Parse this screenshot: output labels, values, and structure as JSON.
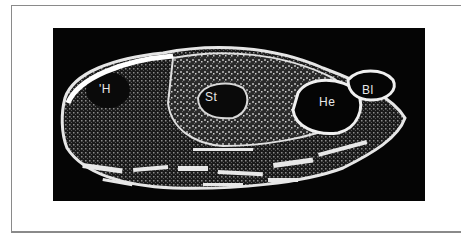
{
  "figure": {
    "labels": {
      "h": "'H",
      "st": "St",
      "he": "He",
      "bl": "Bl"
    },
    "colors": {
      "background": "#050505",
      "tissue_light": "#e8e8e8",
      "tissue_mid": "#7a7a7a",
      "frame_border": "#8a8a8a"
    }
  }
}
